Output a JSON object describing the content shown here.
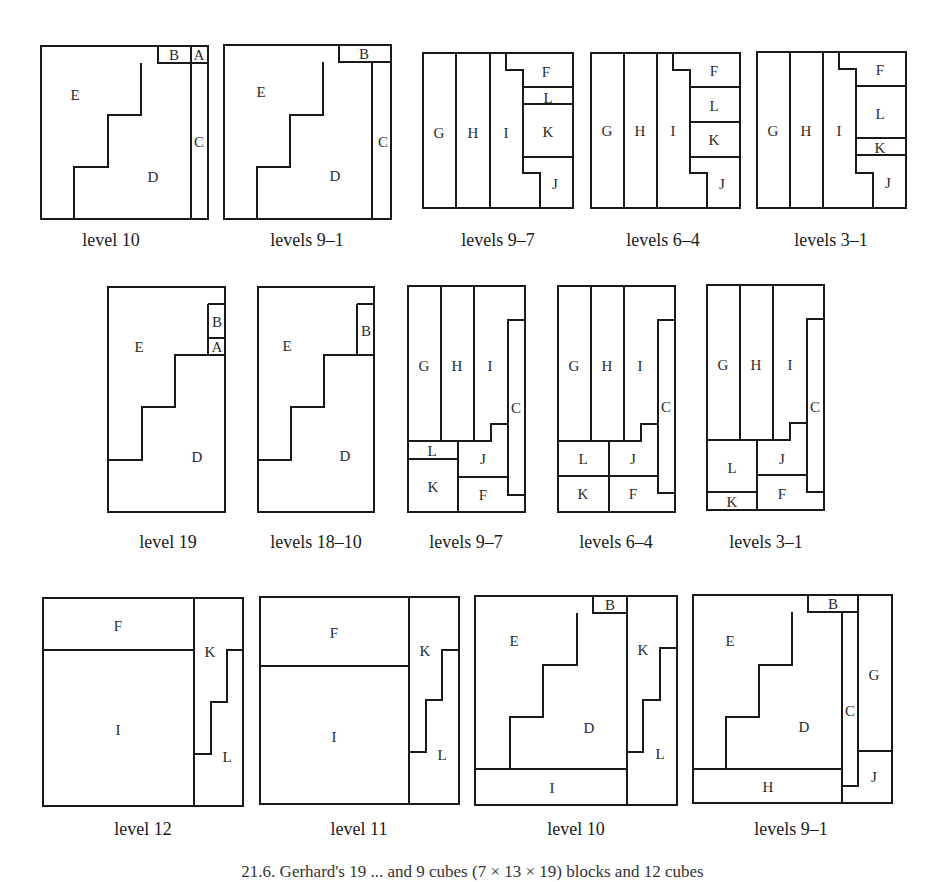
{
  "figure_caption_fragment": "21.6. Gerhard's 19 ... and 9 cubes (7 × 13 × 19) blocks and 12 cubes",
  "rows": [
    {
      "panels": [
        {
          "caption": "level 10",
          "outer": [
            41,
            46,
            208,
            219
          ],
          "lines": [
            "M158,46 L158,63 L208,63",
            "M191,46 L191,219",
            "M141,63 L141,115 L108,115 L108,167 L74,167 L74,219"
          ],
          "labels": [
            {
              "t": "E",
              "x": 75,
              "y": 95
            },
            {
              "t": "B",
              "x": 174,
              "y": 55
            },
            {
              "t": "A",
              "x": 199,
              "y": 55
            },
            {
              "t": "C",
              "x": 199,
              "y": 142
            },
            {
              "t": "D",
              "x": 153,
              "y": 177
            }
          ]
        },
        {
          "caption": "levels 9–1",
          "outer": [
            224,
            45,
            391,
            219
          ],
          "lines": [
            "M339,45 L339,62 L391,62",
            "M372,62 L372,219",
            "M323,62 L323,115 L290,115 L290,167 L257,167 L257,219"
          ],
          "labels": [
            {
              "t": "E",
              "x": 261,
              "y": 92
            },
            {
              "t": "B",
              "x": 364,
              "y": 54
            },
            {
              "t": "C",
              "x": 383,
              "y": 142
            },
            {
              "t": "D",
              "x": 335,
              "y": 176
            }
          ]
        },
        {
          "caption": "levels 9–7",
          "outer": [
            423,
            53,
            573,
            208
          ],
          "lines": [
            "M456,53 L456,208",
            "M490,53 L490,208",
            "M506,53 L506,70 L523,70 L523,173 L540,173 L540,208",
            "M523,87 L573,87",
            "M523,104 L573,104",
            "M523,157 L573,157"
          ],
          "labels": [
            {
              "t": "G",
              "x": 439,
              "y": 133
            },
            {
              "t": "H",
              "x": 473,
              "y": 133
            },
            {
              "t": "I",
              "x": 506,
              "y": 133
            },
            {
              "t": "F",
              "x": 546,
              "y": 72
            },
            {
              "t": "L",
              "x": 548,
              "y": 98
            },
            {
              "t": "K",
              "x": 548,
              "y": 132
            },
            {
              "t": "J",
              "x": 555,
              "y": 184
            }
          ]
        },
        {
          "caption": "levels 6–4",
          "outer": [
            591,
            53,
            740,
            208
          ],
          "lines": [
            "M624,53 L624,208",
            "M657,53 L657,208",
            "M673,53 L673,70 L690,70 L690,173 L707,173 L707,208",
            "M690,87 L740,87",
            "M690,122 L740,122",
            "M690,157 L740,157"
          ],
          "labels": [
            {
              "t": "G",
              "x": 607,
              "y": 131
            },
            {
              "t": "H",
              "x": 640,
              "y": 131
            },
            {
              "t": "I",
              "x": 673,
              "y": 131
            },
            {
              "t": "F",
              "x": 714,
              "y": 71
            },
            {
              "t": "L",
              "x": 714,
              "y": 106
            },
            {
              "t": "K",
              "x": 714,
              "y": 140
            },
            {
              "t": "J",
              "x": 722,
              "y": 184
            }
          ]
        },
        {
          "caption": "levels 3–1",
          "outer": [
            757,
            52,
            906,
            208
          ],
          "lines": [
            "M790,52 L790,208",
            "M823,52 L823,208",
            "M839,52 L839,69 L856,69 L856,173 L873,173 L873,208",
            "M856,86 L906,86",
            "M856,138 L906,138",
            "M856,155 L906,155"
          ],
          "labels": [
            {
              "t": "G",
              "x": 773,
              "y": 131
            },
            {
              "t": "H",
              "x": 806,
              "y": 131
            },
            {
              "t": "I",
              "x": 839,
              "y": 131
            },
            {
              "t": "F",
              "x": 880,
              "y": 70
            },
            {
              "t": "L",
              "x": 880,
              "y": 114
            },
            {
              "t": "K",
              "x": 880,
              "y": 148
            },
            {
              "t": "J",
              "x": 888,
              "y": 183
            }
          ]
        }
      ]
    },
    {
      "panels": [
        {
          "caption": "level 19",
          "outer": [
            108,
            287,
            225,
            512
          ],
          "lines": [
            "M208,304 L225,304",
            "M208,304 L208,355",
            "M208,338 L225,338",
            "M225,355 L175,355 L175,407 L142,407 L142,460 L108,460"
          ],
          "labels": [
            {
              "t": "E",
              "x": 139,
              "y": 347
            },
            {
              "t": "B",
              "x": 217,
              "y": 322
            },
            {
              "t": "A",
              "x": 217,
              "y": 347
            },
            {
              "t": "D",
              "x": 197,
              "y": 457
            }
          ]
        },
        {
          "caption": "levels 18–10",
          "outer": [
            258,
            287,
            374,
            512
          ],
          "lines": [
            "M357,304 L374,304",
            "M357,304 L357,355",
            "M374,355 L324,355 L324,407 L291,407 L291,460 L258,460"
          ],
          "labels": [
            {
              "t": "E",
              "x": 287,
              "y": 346
            },
            {
              "t": "B",
              "x": 366,
              "y": 331
            },
            {
              "t": "D",
              "x": 345,
              "y": 456
            }
          ]
        },
        {
          "caption": "levels 9–7",
          "outer": [
            408,
            286,
            525,
            512
          ],
          "lines": [
            "M441,286 L441,441",
            "M474,286 L474,441",
            "M525,320 L508,320 L508,495 L525,495",
            "M508,424 L491,424 L491,441 L408,441",
            "M408,459 L458,459",
            "M458,441 L458,512",
            "M458,477 L508,477"
          ],
          "labels": [
            {
              "t": "G",
              "x": 424,
              "y": 366
            },
            {
              "t": "H",
              "x": 457,
              "y": 366
            },
            {
              "t": "I",
              "x": 490,
              "y": 366
            },
            {
              "t": "C",
              "x": 516,
              "y": 408
            },
            {
              "t": "L",
              "x": 432,
              "y": 451
            },
            {
              "t": "J",
              "x": 483,
              "y": 459
            },
            {
              "t": "K",
              "x": 433,
              "y": 487
            },
            {
              "t": "F",
              "x": 483,
              "y": 495
            }
          ]
        },
        {
          "caption": "levels 6–4",
          "outer": [
            558,
            286,
            675,
            512
          ],
          "lines": [
            "M591,286 L591,441",
            "M624,286 L624,441",
            "M675,320 L658,320 L658,493 L675,493",
            "M658,424 L641,424 L641,441 L558,441",
            "M558,476 L658,476",
            "M609,441 L609,512"
          ],
          "labels": [
            {
              "t": "G",
              "x": 574,
              "y": 366
            },
            {
              "t": "H",
              "x": 607,
              "y": 366
            },
            {
              "t": "I",
              "x": 640,
              "y": 366
            },
            {
              "t": "C",
              "x": 666,
              "y": 407
            },
            {
              "t": "L",
              "x": 583,
              "y": 459
            },
            {
              "t": "J",
              "x": 633,
              "y": 459
            },
            {
              "t": "K",
              "x": 583,
              "y": 494
            },
            {
              "t": "F",
              "x": 633,
              "y": 494
            }
          ]
        },
        {
          "caption": "levels 3–1",
          "outer": [
            707,
            285,
            824,
            510
          ],
          "lines": [
            "M740,285 L740,440",
            "M773,285 L773,440",
            "M824,319 L807,319 L807,492 L824,492",
            "M807,423 L790,423 L790,440 L707,440",
            "M707,492 L757,492",
            "M757,440 L757,510",
            "M757,475 L807,475"
          ],
          "labels": [
            {
              "t": "G",
              "x": 723,
              "y": 365
            },
            {
              "t": "H",
              "x": 756,
              "y": 365
            },
            {
              "t": "I",
              "x": 790,
              "y": 365
            },
            {
              "t": "C",
              "x": 815,
              "y": 407
            },
            {
              "t": "L",
              "x": 732,
              "y": 468
            },
            {
              "t": "J",
              "x": 782,
              "y": 459
            },
            {
              "t": "K",
              "x": 732,
              "y": 502
            },
            {
              "t": "F",
              "x": 782,
              "y": 494
            }
          ]
        }
      ]
    },
    {
      "panels": [
        {
          "caption": "level 12",
          "outer": [
            43,
            598,
            243,
            806
          ],
          "lines": [
            "M43,650 L194,650",
            "M194,598 L194,806",
            "M243,650 L227,650 L227,702 L211,702 L211,754 L194,754"
          ],
          "labels": [
            {
              "t": "F",
              "x": 118,
              "y": 626
            },
            {
              "t": "K",
              "x": 210,
              "y": 652
            },
            {
              "t": "I",
              "x": 118,
              "y": 730
            },
            {
              "t": "L",
              "x": 227,
              "y": 757
            }
          ]
        },
        {
          "caption": "level 11",
          "outer": [
            260,
            597,
            459,
            804
          ],
          "lines": [
            "M260,666 L409,666",
            "M409,597 L409,804",
            "M459,650 L442,650 L442,700 L426,700 L426,752 L409,752"
          ],
          "labels": [
            {
              "t": "F",
              "x": 334,
              "y": 633
            },
            {
              "t": "K",
              "x": 425,
              "y": 651
            },
            {
              "t": "I",
              "x": 334,
              "y": 737
            },
            {
              "t": "L",
              "x": 442,
              "y": 755
            }
          ]
        },
        {
          "caption": "level 10",
          "outer": [
            475,
            596,
            677,
            805
          ],
          "lines": [
            "M593,596 L593,613 L627,613",
            "M627,596 L627,805",
            "M577,613 L577,665 L543,665 L543,717 L510,717 L510,769",
            "M475,769 L627,769",
            "M677,648 L660,648 L660,700 L643,700 L643,752 L627,752"
          ],
          "labels": [
            {
              "t": "E",
              "x": 514,
              "y": 641
            },
            {
              "t": "B",
              "x": 610,
              "y": 605
            },
            {
              "t": "K",
              "x": 643,
              "y": 650
            },
            {
              "t": "D",
              "x": 589,
              "y": 728
            },
            {
              "t": "L",
              "x": 660,
              "y": 754
            },
            {
              "t": "I",
              "x": 552,
              "y": 788
            }
          ]
        },
        {
          "caption": "levels 9–1",
          "outer": [
            693,
            595,
            892,
            803
          ],
          "lines": [
            "M808,595 L808,612 L858,612",
            "M858,595 L858,751",
            "M792,612 L792,665 L759,665 L759,717 L726,717 L726,769",
            "M842,612 L842,786 L858,786 L858,751",
            "M693,769 L842,769",
            "M842,786 L842,803",
            "M858,751 L892,751"
          ],
          "labels": [
            {
              "t": "E",
              "x": 730,
              "y": 641
            },
            {
              "t": "B",
              "x": 833,
              "y": 604
            },
            {
              "t": "G",
              "x": 874,
              "y": 675
            },
            {
              "t": "C",
              "x": 850,
              "y": 711
            },
            {
              "t": "D",
              "x": 804,
              "y": 727
            },
            {
              "t": "J",
              "x": 874,
              "y": 777
            },
            {
              "t": "H",
              "x": 768,
              "y": 787
            }
          ]
        }
      ]
    }
  ],
  "caption_rows_y": [
    246,
    548,
    835
  ],
  "caption_x": {
    "0": [
      111,
      307,
      498,
      663,
      831
    ],
    "1": [
      168,
      316,
      466,
      616,
      766
    ],
    "2": [
      143,
      359,
      576,
      791
    ]
  },
  "colors": {
    "stroke": "#1a1a1a",
    "text": "#2a2a2a",
    "background": "#ffffff"
  }
}
